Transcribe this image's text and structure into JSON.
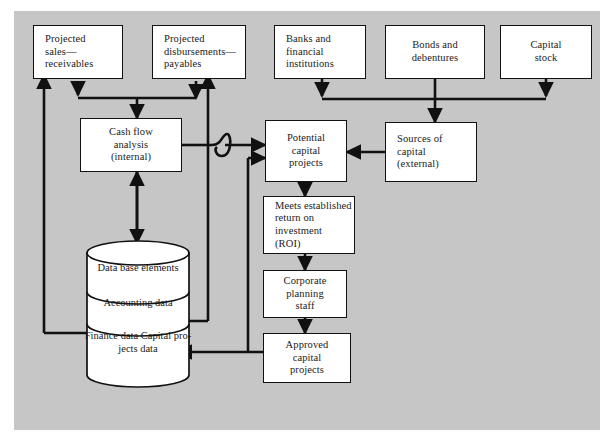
{
  "diagram": {
    "background_color": "#c6c6c6",
    "page_color": "#ffffff",
    "node_fill": "#ffffff",
    "line_color": "#111111",
    "nodes": [
      {
        "id": "projected-sales",
        "lines": [
          "Projected",
          "sales—",
          "receivables"
        ],
        "align": "left"
      },
      {
        "id": "projected-disb",
        "lines": [
          "Projected",
          "disbursements—",
          "payables"
        ],
        "align": "left"
      },
      {
        "id": "banks",
        "lines": [
          "Banks and",
          "financial",
          "institutions"
        ],
        "align": "left"
      },
      {
        "id": "bonds",
        "lines": [
          "Bonds and",
          "debentures"
        ],
        "align": "center"
      },
      {
        "id": "capital-stock",
        "lines": [
          "Capital",
          "stock"
        ],
        "align": "center"
      },
      {
        "id": "cash-flow",
        "lines": [
          "Cash flow",
          "analysis",
          "(internal)"
        ],
        "align": "center"
      },
      {
        "id": "potential-projects",
        "lines": [
          "Potential",
          "capital",
          "projects"
        ],
        "align": "center"
      },
      {
        "id": "sources-capital",
        "lines": [
          "Sources of",
          "capital",
          "(external)"
        ],
        "align": "left"
      },
      {
        "id": "meets-roi",
        "lines": [
          "Meets established",
          "return on",
          "investment",
          "(ROI)"
        ],
        "align": "left"
      },
      {
        "id": "corporate-planning",
        "lines": [
          "Corporate",
          "planning",
          "staff"
        ],
        "align": "center"
      },
      {
        "id": "approved-projects",
        "lines": [
          "Approved",
          "capital",
          "projects"
        ],
        "align": "center"
      }
    ],
    "database": {
      "id": "database-cylinder",
      "segments": [
        {
          "id": "db-seg-1",
          "lines": [
            "Data base",
            "elements"
          ]
        },
        {
          "id": "db-seg-2",
          "lines": [
            "Accounting",
            "data"
          ]
        },
        {
          "id": "db-seg-3",
          "lines": [
            "Finance",
            "data",
            "Capital pro-",
            "jects data"
          ]
        }
      ]
    }
  }
}
